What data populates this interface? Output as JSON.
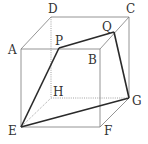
{
  "figure": {
    "type": "cube-cross-section",
    "colors": {
      "edge": "#7a7a7a",
      "hidden": "#8a8a8a",
      "section": "#2a2a2a",
      "label": "#333333"
    },
    "vertices": {
      "A": {
        "label": "A",
        "x": 21,
        "y": 49
      },
      "B": {
        "label": "B",
        "x": 100,
        "y": 49
      },
      "C": {
        "label": "C",
        "x": 129,
        "y": 17
      },
      "D": {
        "label": "D",
        "x": 51,
        "y": 17
      },
      "E": {
        "label": "E",
        "x": 21,
        "y": 127
      },
      "F": {
        "label": "F",
        "x": 100,
        "y": 127
      },
      "G": {
        "label": "G",
        "x": 129,
        "y": 98
      },
      "H": {
        "label": "H",
        "x": 51,
        "y": 98
      },
      "P": {
        "label": "P",
        "x": 59,
        "y": 48
      },
      "Q": {
        "label": "Q",
        "x": 114,
        "y": 32
      }
    },
    "labels": {
      "A": "A",
      "B": "B",
      "C": "C",
      "D": "D",
      "E": "E",
      "F": "F",
      "G": "G",
      "H": "H",
      "P": "P",
      "Q": "Q"
    },
    "section": [
      "E",
      "P",
      "Q",
      "G"
    ]
  }
}
